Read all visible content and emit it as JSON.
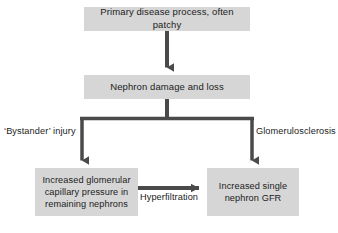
{
  "diagram": {
    "accent_color": "#4a4a4a",
    "node_fill_color": "#d6d6d6",
    "text_color": "#1c1c1c",
    "background_color": "#ffffff",
    "nodes": [
      {
        "id": "primary",
        "label": "Primary disease process, often patchy"
      },
      {
        "id": "nephron",
        "label": "Nephron damage and loss"
      },
      {
        "id": "capillary",
        "label": "Increased glomerular\ncapillary pressure in\nremaining nephrons"
      },
      {
        "id": "gfr",
        "label": "Increased single\nnephron GFR"
      }
    ],
    "edge_labels": [
      {
        "id": "bystander",
        "label": "‘Bystander’ injury"
      },
      {
        "id": "glomerulosclerosis",
        "label": "Glomerulosclerosis"
      },
      {
        "id": "hyperfiltration",
        "label": "Hyperfiltration"
      }
    ]
  }
}
